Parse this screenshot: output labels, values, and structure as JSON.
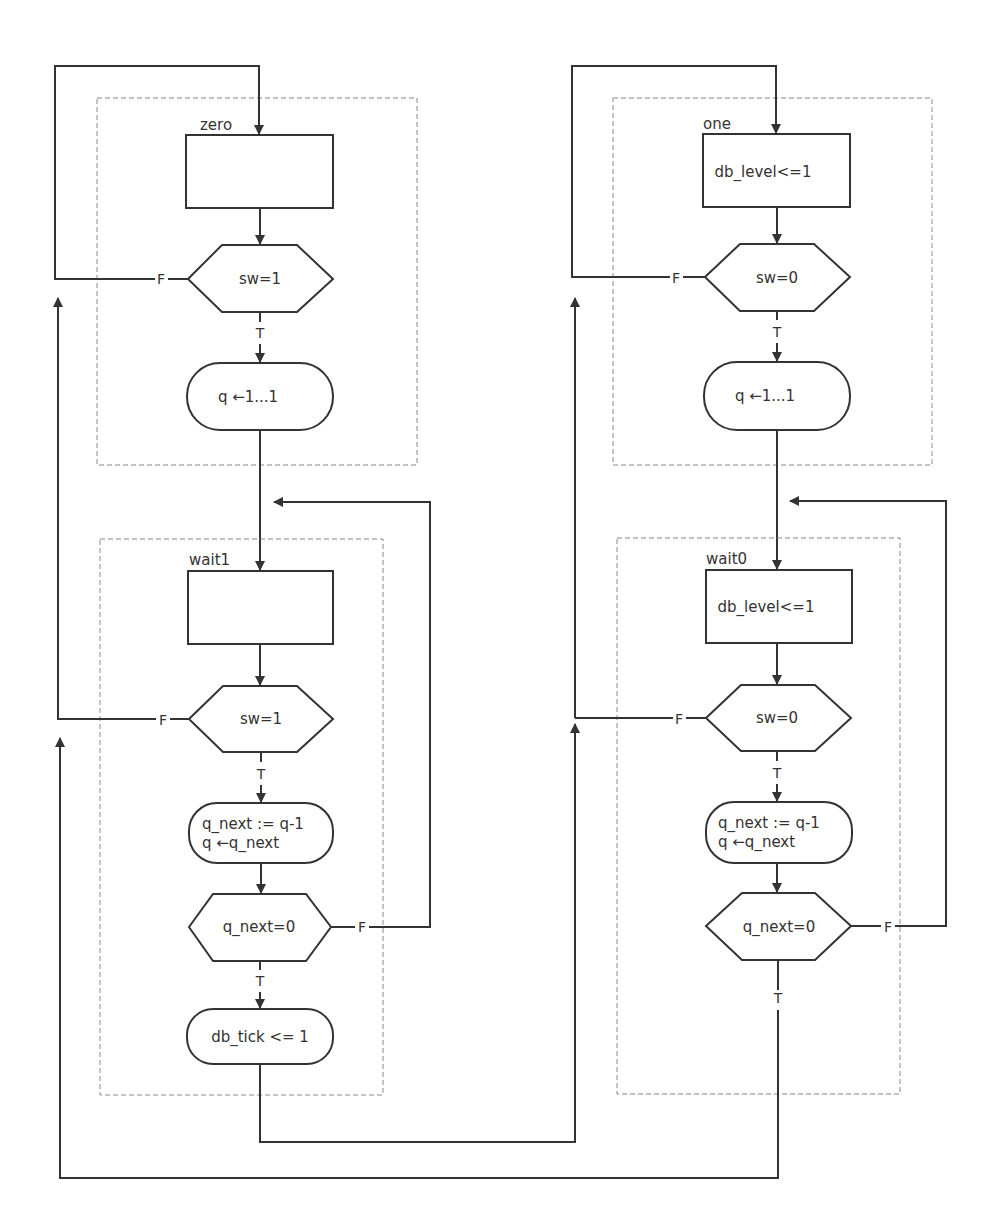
{
  "diagram": {
    "type": "ASM chart (switch debouncer)",
    "states": {
      "zero": {
        "name": "zero",
        "state_box_text": "",
        "decision": "sw=1",
        "conditional_output": "q ←1...1"
      },
      "wait1": {
        "name": "wait1",
        "state_box_text": "",
        "decision1": "sw=1",
        "conditional_output1_line1": "q_next := q-1",
        "conditional_output1_line2": "q ←q_next",
        "decision2": "q_next=0",
        "conditional_output2": "db_tick <= 1"
      },
      "one": {
        "name": "one",
        "state_box_text": "db_level<=1",
        "decision": "sw=0",
        "conditional_output": "q ←1...1"
      },
      "wait0": {
        "name": "wait0",
        "state_box_text": "db_level<=1",
        "decision1": "sw=0",
        "conditional_output1_line1": "q_next := q-1",
        "conditional_output1_line2": "q ←q_next",
        "decision2": "q_next=0"
      }
    },
    "branch_labels": {
      "true": "T",
      "false": "F"
    },
    "colors": {
      "stroke": "#333333",
      "dashed_border": "#888888",
      "background": "#ffffff"
    }
  }
}
